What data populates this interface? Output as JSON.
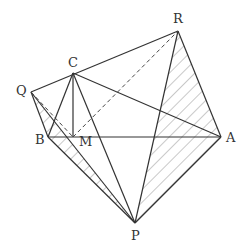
{
  "diagram": {
    "type": "geometry",
    "points": {
      "A": {
        "label": "A",
        "x": 221,
        "y": 137
      },
      "B": {
        "label": "B",
        "x": 48,
        "y": 137
      },
      "C": {
        "label": "C",
        "x": 73,
        "y": 73
      },
      "M": {
        "label": "M",
        "x": 73,
        "y": 137
      },
      "P": {
        "label": "P",
        "x": 135,
        "y": 223
      },
      "Q": {
        "label": "Q",
        "x": 31,
        "y": 92
      },
      "R": {
        "label": "R",
        "x": 178,
        "y": 31
      }
    },
    "solid_segments": [
      "QR",
      "QB",
      "QP",
      "CB",
      "CM",
      "CP",
      "CA",
      "BA",
      "BP",
      "AP",
      "RP",
      "RA"
    ],
    "dashed_segments": [
      "QM",
      "MR"
    ],
    "hatched_regions": [
      [
        "Q",
        "B",
        "P"
      ],
      [
        "R",
        "P",
        "A"
      ]
    ],
    "colors": {
      "stroke": "#333333",
      "hatch": "#888888"
    }
  }
}
